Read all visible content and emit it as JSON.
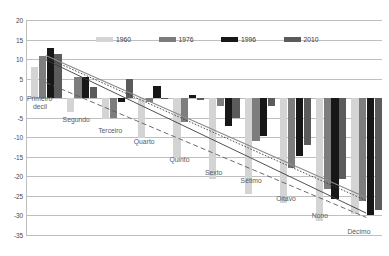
{
  "chart_data": {
    "type": "bar",
    "title": "",
    "subtitle": "",
    "xlabel": "",
    "ylabel": "",
    "ylim": [
      -35,
      20
    ],
    "ytick_step": 5,
    "yticks": [
      20,
      15,
      10,
      5,
      0,
      -5,
      -10,
      -15,
      -20,
      -25,
      -30,
      -35
    ],
    "grid": true,
    "legend_position": "top-center",
    "categories": [
      "Primeiro decil",
      "Segundo",
      "Terceiro",
      "Quarto",
      "Quinto",
      "Sexto",
      "Sétimo",
      "Oitavo",
      "Nono",
      "Décimo"
    ],
    "series": [
      {
        "name": "1960",
        "color": "#d4d4d4",
        "values": [
          8.1,
          -3.6,
          -5.3,
          -10.3,
          -15.2,
          -20.7,
          -24.5,
          -26.8,
          -31.5,
          -29.7
        ]
      },
      {
        "name": "1976",
        "color": "#7d7d7d",
        "values": [
          10.9,
          5.3,
          -5.1,
          -1.1,
          -6.2,
          -2.0,
          -11.0,
          -17.9,
          -23.2,
          -26.2
        ]
      },
      {
        "name": "1996",
        "color": "#171717",
        "values": [
          12.9,
          5.4,
          -1.1,
          3.0,
          0.8,
          -7.1,
          -9.7,
          -14.8,
          -25.9,
          -29.8
        ]
      },
      {
        "name": "2010",
        "color": "#5b5b5b",
        "values": [
          11.2,
          2.8,
          4.9,
          -0.3,
          -0.4,
          -5.0,
          -2.1,
          -12.0,
          -20.6,
          -28.6
        ]
      }
    ],
    "trendlines": [
      {
        "name": "1960",
        "style": "dashed",
        "color": "#5a5a5a",
        "y_start": 4.0,
        "y_end": -30.5
      },
      {
        "name": "1976",
        "style": "solid",
        "color": "#3d3d3d",
        "y_start": 9.8,
        "y_end": -29.4
      },
      {
        "name": "1996",
        "style": "dotted",
        "color": "#3d3d3d",
        "y_start": 10.4,
        "y_end": -26.2
      },
      {
        "name": "2010",
        "style": "solid-light",
        "color": "#8a8a8a",
        "y_start": 10.9,
        "y_end": -25.4
      }
    ]
  },
  "legend": {
    "items": [
      {
        "label": "1960",
        "swatch": "#d4d4d4"
      },
      {
        "label": "1976",
        "swatch": "#7d7d7d"
      },
      {
        "label": "1996",
        "swatch": "#171717"
      },
      {
        "label": "2010",
        "swatch": "#5b5b5b"
      }
    ]
  },
  "category_labels": [
    {
      "text": "Primeiro",
      "text2": "decil"
    },
    {
      "text": "Segundo"
    },
    {
      "text": "Terceiro"
    },
    {
      "text": "Quarto"
    },
    {
      "text": "Quinto"
    },
    {
      "text": "Sexto"
    },
    {
      "text": "Sétimo"
    },
    {
      "text": "Oitavo"
    },
    {
      "text": "Nono"
    },
    {
      "text": "Décimo"
    }
  ]
}
